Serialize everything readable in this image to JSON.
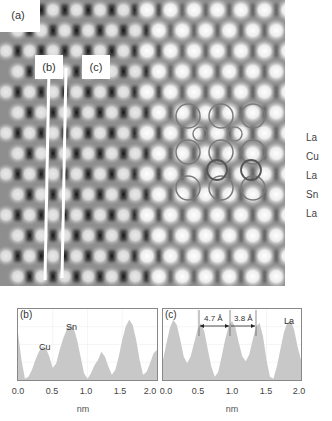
{
  "figure": {
    "panel_a": {
      "tag": "(a)",
      "line_tags": [
        "(b)",
        "(c)"
      ],
      "row_labels": [
        "La",
        "Cu",
        "La",
        "Sn",
        "La"
      ]
    },
    "panel_b": {
      "tag": "(b)",
      "peak_labels": [
        "Cu",
        "Sn"
      ]
    },
    "panel_c": {
      "tag": "(c)",
      "annotations": [
        "4.7 Å",
        "3.8 Å"
      ],
      "peak_labels": [
        "La"
      ]
    },
    "x_ticks": [
      "0.0",
      "0.5",
      "1.0",
      "1.5",
      "2.0"
    ],
    "x_axis_label": "nm",
    "colors": {
      "histogram_fill": "#c8c8c8",
      "frame": "#888888",
      "line_marker": "#ffffff"
    }
  },
  "chart_data": [
    {
      "type": "bar",
      "title": "(b)",
      "xlabel": "nm",
      "ylabel": "",
      "xlim": [
        0.0,
        2.0
      ],
      "x_ticks": [
        0.0,
        0.5,
        1.0,
        1.5,
        2.0
      ],
      "grid": true,
      "annotations": [
        {
          "text": "Cu",
          "x": 0.38
        },
        {
          "text": "Sn",
          "x": 0.78
        }
      ],
      "x": [
        0.0,
        0.05,
        0.1,
        0.15,
        0.2,
        0.25,
        0.3,
        0.35,
        0.4,
        0.45,
        0.5,
        0.55,
        0.6,
        0.65,
        0.7,
        0.75,
        0.8,
        0.85,
        0.9,
        0.95,
        1.0,
        1.05,
        1.1,
        1.15,
        1.2,
        1.25,
        1.3,
        1.35,
        1.4,
        1.45,
        1.5,
        1.55,
        1.6,
        1.65,
        1.7,
        1.75,
        1.8,
        1.85,
        1.9,
        1.95,
        2.0
      ],
      "values": [
        0.7,
        0.3,
        0.02,
        0.05,
        0.15,
        0.3,
        0.42,
        0.5,
        0.48,
        0.35,
        0.18,
        0.25,
        0.45,
        0.62,
        0.75,
        0.82,
        0.78,
        0.6,
        0.35,
        0.1,
        0.02,
        0.1,
        0.22,
        0.3,
        0.42,
        0.35,
        0.2,
        0.08,
        0.15,
        0.35,
        0.6,
        0.8,
        0.9,
        0.82,
        0.6,
        0.3,
        0.08,
        0.12,
        0.25,
        0.4,
        0.45
      ]
    },
    {
      "type": "bar",
      "title": "(c)",
      "xlabel": "nm",
      "ylabel": "",
      "xlim": [
        0.0,
        2.0
      ],
      "x_ticks": [
        0.0,
        0.5,
        1.0,
        1.5,
        2.0
      ],
      "grid": true,
      "annotations": [
        {
          "text": "4.7 Å",
          "x_start": 0.55,
          "x_end": 1.0
        },
        {
          "text": "3.8 Å",
          "x_start": 1.0,
          "x_end": 1.38
        },
        {
          "text": "La",
          "x": 1.85
        }
      ],
      "x": [
        0.0,
        0.05,
        0.1,
        0.15,
        0.2,
        0.25,
        0.3,
        0.35,
        0.4,
        0.45,
        0.5,
        0.55,
        0.6,
        0.65,
        0.7,
        0.75,
        0.8,
        0.85,
        0.9,
        0.95,
        1.0,
        1.05,
        1.1,
        1.15,
        1.2,
        1.25,
        1.3,
        1.35,
        1.4,
        1.45,
        1.5,
        1.55,
        1.6,
        1.65,
        1.7,
        1.75,
        1.8,
        1.85,
        1.9,
        1.95,
        2.0
      ],
      "values": [
        0.3,
        0.55,
        0.78,
        0.9,
        0.82,
        0.6,
        0.35,
        0.25,
        0.35,
        0.55,
        0.75,
        0.85,
        0.72,
        0.45,
        0.2,
        0.05,
        0.12,
        0.35,
        0.6,
        0.8,
        0.88,
        0.78,
        0.55,
        0.35,
        0.28,
        0.38,
        0.6,
        0.8,
        0.85,
        0.65,
        0.3,
        0.05,
        0.02,
        0.2,
        0.45,
        0.7,
        0.85,
        0.9,
        0.75,
        0.5,
        0.3
      ]
    }
  ]
}
